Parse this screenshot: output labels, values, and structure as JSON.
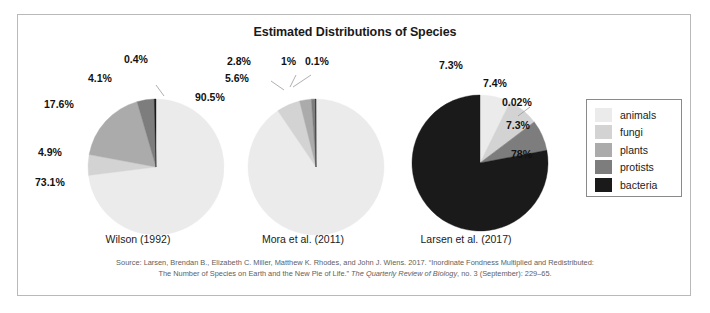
{
  "figure": {
    "title": "Estimated Distributions of Species",
    "source_line_1": "Source: Larsen, Brendan B., Elizabeth C. Miller, Matthew K. Rhodes, and John J. Wiens. 2017. “Inordinate Fondness Multiplied and Redistributed:",
    "source_line_2_a": "The Number of Species on Earth and the New Pie of Life.” ",
    "source_line_2_b": "The Quarterly Review of Biology",
    "source_line_2_c": ", no. 3 (September): 229–65."
  },
  "legend": {
    "items": [
      {
        "label": "animals",
        "color": "#ebebeb"
      },
      {
        "label": "fungi",
        "color": "#d3d3d3"
      },
      {
        "label": "plants",
        "color": "#ababab"
      },
      {
        "label": "protists",
        "color": "#7d7d7d"
      },
      {
        "label": "bacteria",
        "color": "#1a1a1a"
      }
    ]
  },
  "chart_data": {
    "type": "pie",
    "title": "Estimated Distributions of Species",
    "legend_position": "right",
    "categories": [
      "animals",
      "fungi",
      "plants",
      "protists",
      "bacteria"
    ],
    "colors": [
      "#ebebeb",
      "#d3d3d3",
      "#ababab",
      "#7d7d7d",
      "#1a1a1a"
    ],
    "charts": [
      {
        "caption": "Wilson (1992)",
        "values": [
          73.1,
          4.9,
          17.6,
          4.1,
          0.4
        ],
        "labels": [
          "73.1%",
          "4.9%",
          "17.6%",
          "4.1%",
          "0.4%"
        ]
      },
      {
        "caption": "Mora et al. (2011)",
        "values": [
          90.5,
          5.6,
          2.8,
          1.0,
          0.1
        ],
        "labels": [
          "90.5%",
          "5.6%",
          "2.8%",
          "1%",
          "0.1%"
        ]
      },
      {
        "caption": "Larsen et al. (2017)",
        "values": [
          7.3,
          7.4,
          0.02,
          7.3,
          78.0
        ],
        "labels": [
          "7.3%",
          "7.4%",
          "0.02%",
          "7.3%",
          "78%"
        ]
      }
    ]
  }
}
